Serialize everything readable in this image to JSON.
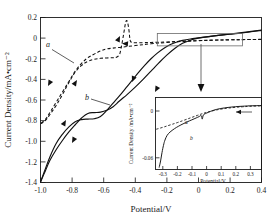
{
  "chart_data": {
    "type": "line",
    "title": "",
    "xlabel": "Potential/V",
    "ylabel": "Current Density/mA•cm⁻²",
    "xlim": [
      -1.0,
      0.4
    ],
    "ylim": [
      -1.4,
      0.2
    ],
    "xticks": [
      "-1.0",
      "-0.8",
      "-0.6",
      "-0.4",
      "-0.2",
      "0",
      "0.2",
      "0.4"
    ],
    "xtick_values": [
      -1.0,
      -0.8,
      -0.6,
      -0.4,
      -0.2,
      0,
      0.2,
      0.4
    ],
    "yticks": [
      "0.2",
      "0",
      "-0.2",
      "-0.4",
      "-0.6",
      "-0.8",
      "-1.0",
      "-1.2",
      "-1.4"
    ],
    "ytick_values": [
      0.2,
      0,
      -0.2,
      -0.4,
      -0.6,
      -0.8,
      -1.0,
      -1.2,
      -1.4
    ],
    "grid": false,
    "legend": "inline-labels",
    "annotations": [
      {
        "text": "a",
        "x": -0.88,
        "y": -0.07,
        "target_x": -0.77,
        "target_y": -0.23
      },
      {
        "text": "b",
        "x": -0.62,
        "y": -0.58,
        "target_x": -0.5,
        "target_y": -0.66
      }
    ],
    "series": [
      {
        "name": "a",
        "style": "dashed",
        "description": "Cyclic voltammogram, dashed curve with anodic stripping peak near -0.45 V",
        "cathodic_sweep": [
          [
            0.4,
            -0.012
          ],
          [
            0.3,
            -0.014
          ],
          [
            0.2,
            -0.017
          ],
          [
            0.1,
            -0.02
          ],
          [
            0.0,
            -0.025
          ],
          [
            -0.1,
            -0.032
          ],
          [
            -0.2,
            -0.042
          ],
          [
            -0.3,
            -0.055
          ],
          [
            -0.4,
            -0.072
          ],
          [
            -0.5,
            -0.09
          ],
          [
            -0.58,
            -0.105
          ],
          [
            -0.62,
            -0.125
          ],
          [
            -0.66,
            -0.155
          ],
          [
            -0.7,
            -0.19
          ],
          [
            -0.74,
            -0.245
          ],
          [
            -0.78,
            -0.32
          ],
          [
            -0.82,
            -0.42
          ],
          [
            -0.86,
            -0.52
          ],
          [
            -0.9,
            -0.62
          ],
          [
            -0.94,
            -0.72
          ],
          [
            -0.97,
            -0.79
          ],
          [
            -1.0,
            -0.83
          ]
        ],
        "anodic_sweep": [
          [
            -1.0,
            -0.83
          ],
          [
            -0.97,
            -0.8
          ],
          [
            -0.94,
            -0.74
          ],
          [
            -0.9,
            -0.65
          ],
          [
            -0.86,
            -0.545
          ],
          [
            -0.82,
            -0.43
          ],
          [
            -0.78,
            -0.33
          ],
          [
            -0.74,
            -0.265
          ],
          [
            -0.7,
            -0.225
          ],
          [
            -0.66,
            -0.205
          ],
          [
            -0.62,
            -0.196
          ],
          [
            -0.58,
            -0.192
          ],
          [
            -0.54,
            -0.19
          ],
          [
            -0.52,
            -0.186
          ],
          [
            -0.5,
            -0.16
          ],
          [
            -0.49,
            -0.1
          ],
          [
            -0.48,
            -0.02
          ],
          [
            -0.47,
            0.07
          ],
          [
            -0.462,
            0.14
          ],
          [
            -0.455,
            0.17
          ],
          [
            -0.448,
            0.15
          ],
          [
            -0.44,
            0.08
          ],
          [
            -0.435,
            0.01
          ],
          [
            -0.43,
            -0.03
          ],
          [
            -0.42,
            -0.042
          ],
          [
            -0.4,
            -0.045
          ],
          [
            -0.35,
            -0.044
          ],
          [
            -0.3,
            -0.042
          ],
          [
            -0.2,
            -0.037
          ],
          [
            -0.1,
            -0.03
          ],
          [
            0.0,
            -0.024
          ],
          [
            0.1,
            -0.019
          ],
          [
            0.2,
            -0.016
          ],
          [
            0.3,
            -0.014
          ],
          [
            0.4,
            -0.013
          ]
        ]
      },
      {
        "name": "b",
        "style": "solid",
        "description": "Cyclic voltammogram, solid curve with shoulder near -0.65 V",
        "cathodic_sweep": [
          [
            0.4,
            0.075
          ],
          [
            0.3,
            0.055
          ],
          [
            0.2,
            0.038
          ],
          [
            0.1,
            0.022
          ],
          [
            0.0,
            0.0
          ],
          [
            -0.05,
            -0.02
          ],
          [
            -0.1,
            -0.05
          ],
          [
            -0.15,
            -0.1
          ],
          [
            -0.2,
            -0.165
          ],
          [
            -0.25,
            -0.24
          ],
          [
            -0.3,
            -0.32
          ],
          [
            -0.35,
            -0.4
          ],
          [
            -0.4,
            -0.475
          ],
          [
            -0.45,
            -0.545
          ],
          [
            -0.5,
            -0.61
          ],
          [
            -0.54,
            -0.665
          ],
          [
            -0.58,
            -0.7
          ],
          [
            -0.62,
            -0.718
          ],
          [
            -0.66,
            -0.722
          ],
          [
            -0.7,
            -0.73
          ],
          [
            -0.74,
            -0.775
          ],
          [
            -0.78,
            -0.84
          ],
          [
            -0.82,
            -0.91
          ],
          [
            -0.86,
            -0.99
          ],
          [
            -0.9,
            -1.08
          ],
          [
            -0.94,
            -1.185
          ],
          [
            -0.97,
            -1.29
          ],
          [
            -1.0,
            -1.395
          ]
        ],
        "anodic_sweep": [
          [
            -1.0,
            -1.395
          ],
          [
            -0.97,
            -1.27
          ],
          [
            -0.94,
            -1.15
          ],
          [
            -0.9,
            -1.02
          ],
          [
            -0.86,
            -0.93
          ],
          [
            -0.82,
            -0.86
          ],
          [
            -0.78,
            -0.81
          ],
          [
            -0.74,
            -0.79
          ],
          [
            -0.7,
            -0.785
          ],
          [
            -0.66,
            -0.782
          ],
          [
            -0.62,
            -0.76
          ],
          [
            -0.58,
            -0.7
          ],
          [
            -0.54,
            -0.63
          ],
          [
            -0.5,
            -0.56
          ],
          [
            -0.46,
            -0.485
          ],
          [
            -0.42,
            -0.41
          ],
          [
            -0.38,
            -0.335
          ],
          [
            -0.34,
            -0.265
          ],
          [
            -0.3,
            -0.2
          ],
          [
            -0.26,
            -0.145
          ],
          [
            -0.22,
            -0.1
          ],
          [
            -0.18,
            -0.065
          ],
          [
            -0.14,
            -0.04
          ],
          [
            -0.1,
            -0.022
          ],
          [
            -0.05,
            -0.008
          ],
          [
            0.0,
            0.002
          ],
          [
            0.1,
            0.022
          ],
          [
            0.2,
            0.04
          ],
          [
            0.3,
            0.058
          ],
          [
            0.4,
            0.078
          ]
        ]
      }
    ],
    "highlight_box": {
      "x0": -0.26,
      "x1": 0.28,
      "y0": -0.075,
      "y1": 0.045
    },
    "inset": {
      "type": "line",
      "xlabel": "Potential/V",
      "ylabel": "Current Density /mA•cm⁻²",
      "xlim": [
        -0.35,
        0.38
      ],
      "ylim": [
        -0.068,
        0.008
      ],
      "xticks": [
        "-0.3",
        "-0.2",
        "-0.1",
        "0",
        "0.1",
        "0.2",
        "0.3"
      ],
      "xtick_values": [
        -0.3,
        -0.2,
        -0.1,
        0,
        0.1,
        0.2,
        0.3
      ],
      "yticks": [
        "0",
        "-0.06"
      ],
      "ytick_values": [
        0,
        -0.06
      ],
      "grid": false,
      "annotations": [
        {
          "text": "a",
          "x": -0.215,
          "y": -0.018
        },
        {
          "text": "b",
          "x": -0.175,
          "y": -0.036
        }
      ],
      "series": [
        {
          "name": "a",
          "style": "dashed",
          "points": [
            [
              -0.345,
              -0.0255
            ],
            [
              -0.3,
              -0.0235
            ],
            [
              -0.25,
              -0.021
            ],
            [
              -0.2,
              -0.0185
            ],
            [
              -0.15,
              -0.0158
            ],
            [
              -0.1,
              -0.013
            ],
            [
              -0.06,
              -0.0108
            ],
            [
              -0.03,
              -0.0092
            ],
            [
              0.0,
              -0.0078
            ],
            [
              0.05,
              -0.0058
            ],
            [
              0.1,
              -0.0043
            ],
            [
              0.15,
              -0.0032
            ],
            [
              0.2,
              -0.0024
            ],
            [
              0.25,
              -0.0018
            ],
            [
              0.3,
              -0.0013
            ],
            [
              0.38,
              -0.0008
            ]
          ]
        },
        {
          "name": "b",
          "style": "solid",
          "points": [
            [
              -0.325,
              -0.066
            ],
            [
              -0.315,
              -0.059
            ],
            [
              -0.305,
              -0.05
            ],
            [
              -0.295,
              -0.0425
            ],
            [
              -0.285,
              -0.037
            ],
            [
              -0.27,
              -0.032
            ],
            [
              -0.25,
              -0.0285
            ],
            [
              -0.22,
              -0.025
            ],
            [
              -0.19,
              -0.0222
            ],
            [
              -0.16,
              -0.0198
            ],
            [
              -0.13,
              -0.0176
            ],
            [
              -0.1,
              -0.0156
            ],
            [
              -0.07,
              -0.0136
            ],
            [
              -0.05,
              -0.0122
            ],
            [
              -0.035,
              -0.0112
            ],
            [
              -0.028,
              -0.0148
            ],
            [
              -0.02,
              -0.0104
            ],
            [
              0.0,
              -0.0086
            ],
            [
              0.03,
              -0.0066
            ],
            [
              0.06,
              -0.005
            ],
            [
              0.1,
              -0.0036
            ],
            [
              0.15,
              -0.0025
            ],
            [
              0.2,
              -0.0017
            ],
            [
              0.25,
              -0.0012
            ],
            [
              0.3,
              -0.0008
            ],
            [
              0.38,
              -0.0005
            ]
          ]
        }
      ]
    }
  }
}
